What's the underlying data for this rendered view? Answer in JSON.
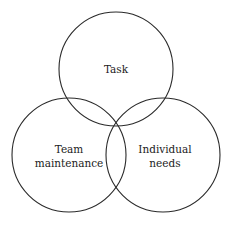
{
  "diagram": {
    "type": "venn",
    "circles": [
      {
        "id": "task",
        "cx": 116,
        "cy": 69,
        "r": 57,
        "label_lines": [
          "Task"
        ]
      },
      {
        "id": "team-maintenance",
        "cx": 69,
        "cy": 155,
        "r": 57,
        "label_lines": [
          "Team",
          "maintenance"
        ]
      },
      {
        "id": "individual-needs",
        "cx": 163,
        "cy": 155,
        "r": 57,
        "label_lines": [
          "Individual",
          "needs"
        ]
      }
    ],
    "stroke_color": "#2a2a2a",
    "background": "#ffffff"
  },
  "labels": {
    "task": "Task",
    "team_line1": "Team",
    "team_line2": "maintenance",
    "individual_line1": "Individual",
    "individual_line2": "needs"
  }
}
